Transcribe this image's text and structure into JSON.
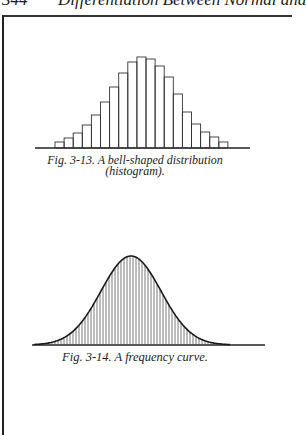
{
  "page": {
    "running_head_page": "344",
    "running_head_title": "Differentiation Between Normal and"
  },
  "figures": [
    {
      "id": "fig-3-13",
      "caption_line1": "Fig. 3-13. A bell-shaped distribution",
      "caption_line2": "(histogram)."
    },
    {
      "id": "fig-3-14",
      "caption": "Fig. 3-14. A frequency curve."
    }
  ],
  "chart_data": [
    {
      "type": "bar",
      "title": "Fig. 3-13. A bell-shaped distribution (histogram).",
      "xlabel": "",
      "ylabel": "",
      "axes": "none (baseline only)",
      "grid": false,
      "categories": [
        "1",
        "2",
        "3",
        "4",
        "5",
        "6",
        "7",
        "8",
        "9",
        "10",
        "11",
        "12",
        "13",
        "14",
        "15",
        "16",
        "17",
        "18",
        "19"
      ],
      "values": [
        6,
        10,
        15,
        23,
        33,
        46,
        61,
        75,
        86,
        91,
        89,
        82,
        71,
        54,
        36,
        24,
        16,
        11,
        6
      ],
      "value_units": "relative height (pixels above baseline)"
    },
    {
      "type": "area",
      "title": "Fig. 3-14. A frequency curve.",
      "description": "Smooth bell-shaped (normal) curve with vertical hatching beneath it",
      "xlabel": "",
      "ylabel": "",
      "grid": false,
      "peak_relative_x": 0.5,
      "peak_height": 89,
      "approx_sigma_px": 30
    }
  ]
}
